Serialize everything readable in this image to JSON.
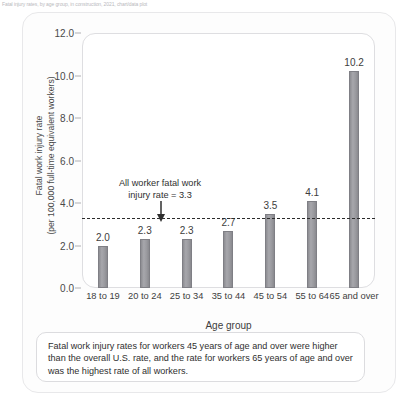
{
  "page_header": "Fatal injury rates, by age group, in construction, 2021, chart/data plot",
  "chart_data": {
    "type": "bar",
    "title": "",
    "categories": [
      "18 to 19",
      "20 to 24",
      "25 to 34",
      "35 to 44",
      "45 to 54",
      "55 to 64",
      "65 and over"
    ],
    "values": [
      2.0,
      2.3,
      2.3,
      2.7,
      3.5,
      4.1,
      10.2
    ],
    "value_labels": [
      "2.0",
      "2.3",
      "2.3",
      "2.7",
      "3.5",
      "4.1",
      "10.2"
    ],
    "xlabel": "Age group",
    "ylabel": "Fatal work injury rate (per 100,000 full-time equivalent workers)",
    "ylabel_line1": "Fatal work injury rate",
    "ylabel_line2": "(per 100,000 full-time equivalent workers)",
    "ylim": [
      0.0,
      12.0
    ],
    "ytick_labels": [
      "12.0",
      "10.0",
      "8.0",
      "6.0",
      "4.0",
      "2.0",
      "0.0"
    ],
    "ytick_values": [
      12.0,
      10.0,
      8.0,
      6.0,
      4.0,
      2.0,
      0.0
    ],
    "grid": false,
    "legend": "none",
    "reference_line": {
      "value": 3.3,
      "style": "dashed",
      "color": "#2b2b2b",
      "annotation_line1": "All worker fatal work",
      "annotation_line2": "injury rate = 3.3"
    },
    "series_color": "#9a9a9f"
  },
  "caption": {
    "text": "Fatal work injury rates for workers 45 years of age and over were higher than the overall U.S. rate, and the rate for workers 65 years of age and over was the highest rate of all workers."
  }
}
